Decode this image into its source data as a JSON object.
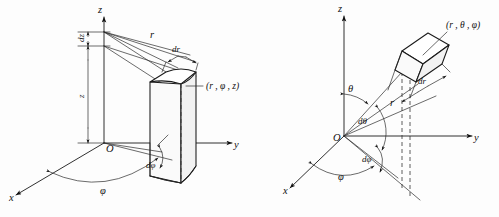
{
  "figure": {
    "background_color": "#fdfdfd",
    "ink_color": "#111111",
    "panels": [
      {
        "id": "cylindrical",
        "name": "cylindrical-coordinates-diagram",
        "axes": {
          "z": "z",
          "y": "y",
          "x": "x"
        },
        "origin_label": "O",
        "labels": {
          "r": "r",
          "dr": "dr",
          "dz": "dz",
          "z": "z",
          "phi": "φ",
          "dphi": "dφ",
          "point": "(r , φ , z)"
        }
      },
      {
        "id": "spherical",
        "name": "spherical-coordinates-diagram",
        "axes": {
          "z": "z",
          "y": "y",
          "x": "x"
        },
        "origin_label": "O",
        "labels": {
          "r": "r",
          "dr": "dr",
          "theta": "θ",
          "dtheta": "dθ",
          "phi": "φ",
          "dphi": "dφ",
          "point": "(r , θ , φ)"
        }
      }
    ]
  }
}
